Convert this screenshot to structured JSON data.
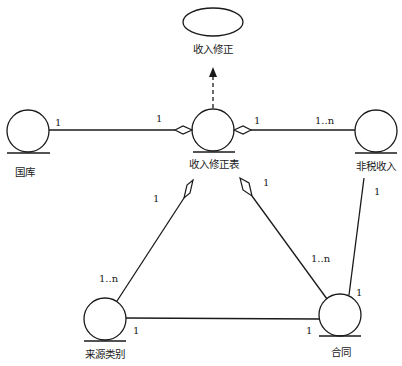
{
  "diagram": {
    "type": "entity-relationship",
    "stroke_color": "#1a1a1a",
    "background": "#ffffff",
    "nodes": {
      "revision": {
        "label": "收入修正",
        "shape": "ellipse"
      },
      "revision_table": {
        "label": "收入修正表",
        "shape": "entity-circle"
      },
      "treasury": {
        "label": "国库",
        "shape": "entity-circle"
      },
      "non_tax_income": {
        "label": "非税收入",
        "shape": "entity-circle"
      },
      "source_category": {
        "label": "来源类别",
        "shape": "entity-circle"
      },
      "contract": {
        "label": "合同",
        "shape": "entity-circle"
      }
    },
    "edges": {
      "treasury_revision_table": {
        "from": "国库",
        "to": "收入修正表",
        "from_mult": "1",
        "to_mult": "1",
        "aggregation_at": "收入修正表"
      },
      "revision_table_non_tax": {
        "from": "收入修正表",
        "to": "非税收入",
        "from_mult": "1",
        "to_mult": "1..n",
        "aggregation_at": "收入修正表"
      },
      "revision_table_source": {
        "from": "收入修正表",
        "to": "来源类别",
        "from_mult": "1",
        "to_mult": "1..n",
        "aggregation_at": "收入修正表"
      },
      "revision_table_contract": {
        "from": "收入修正表",
        "to": "合同",
        "from_mult": "1",
        "to_mult": "1..n",
        "aggregation_at": "收入修正表"
      },
      "source_contract": {
        "from": "来源类别",
        "to": "合同",
        "from_mult": "1",
        "to_mult": "1"
      },
      "non_tax_contract": {
        "from": "非税收入",
        "to": "合同",
        "from_mult": "1",
        "to_mult": ""
      },
      "revision_table_to_revision": {
        "from": "收入修正表",
        "to": "收入修正",
        "style": "dashed-arrow"
      }
    }
  }
}
